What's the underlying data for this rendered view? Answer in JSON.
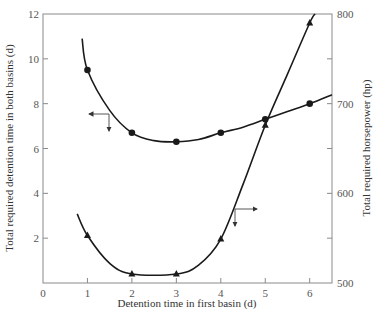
{
  "chart_data": {
    "type": "line",
    "title": "",
    "xlabel": "Detention time in first basin (d)",
    "ylabel": "Total required detention time in both basins (d)",
    "y2label": "Total required horsepower (hp)",
    "xlim": [
      0,
      6.5
    ],
    "ylim": [
      0,
      12
    ],
    "y2lim": [
      500,
      800
    ],
    "grid": false,
    "legend": null,
    "x_ticks": [
      "0",
      "1",
      "2",
      "3",
      "4",
      "5",
      "6"
    ],
    "y_ticks": [
      "0",
      "2",
      "4",
      "6",
      "8",
      "10",
      "12"
    ],
    "y2_ticks": [
      "500",
      "600",
      "700",
      "800"
    ],
    "series": [
      {
        "name": "Total required detention time in both basins (d)",
        "axis": "left",
        "marker": "circle",
        "x": [
          1,
          2,
          3,
          4,
          5,
          6
        ],
        "values": [
          9.5,
          6.7,
          6.3,
          6.7,
          7.3,
          8.0
        ],
        "curve_x": [
          0.88,
          1,
          1.5,
          2,
          2.5,
          3,
          3.5,
          4,
          4.5,
          5,
          5.5,
          6,
          6.5
        ],
        "curve_y": [
          10.9,
          9.5,
          7.7,
          6.7,
          6.35,
          6.3,
          6.4,
          6.7,
          6.95,
          7.3,
          7.65,
          8.0,
          8.4
        ],
        "annotation": "arrow pointing left to left axis"
      },
      {
        "name": "Total required horsepower (hp)",
        "axis": "right",
        "marker": "triangle",
        "x": [
          1,
          2,
          3,
          4,
          5,
          6
        ],
        "values": [
          553,
          510,
          510,
          549,
          676,
          790
        ],
        "curve_x": [
          0.77,
          1,
          1.5,
          2,
          3,
          3.5,
          4,
          4.5,
          5,
          5.5,
          6,
          6.12
        ],
        "curve_y": [
          577,
          553,
          522,
          510,
          510,
          520,
          549,
          610,
          676,
          733,
          790,
          800
        ],
        "annotation": "arrow pointing right to right axis"
      }
    ]
  }
}
